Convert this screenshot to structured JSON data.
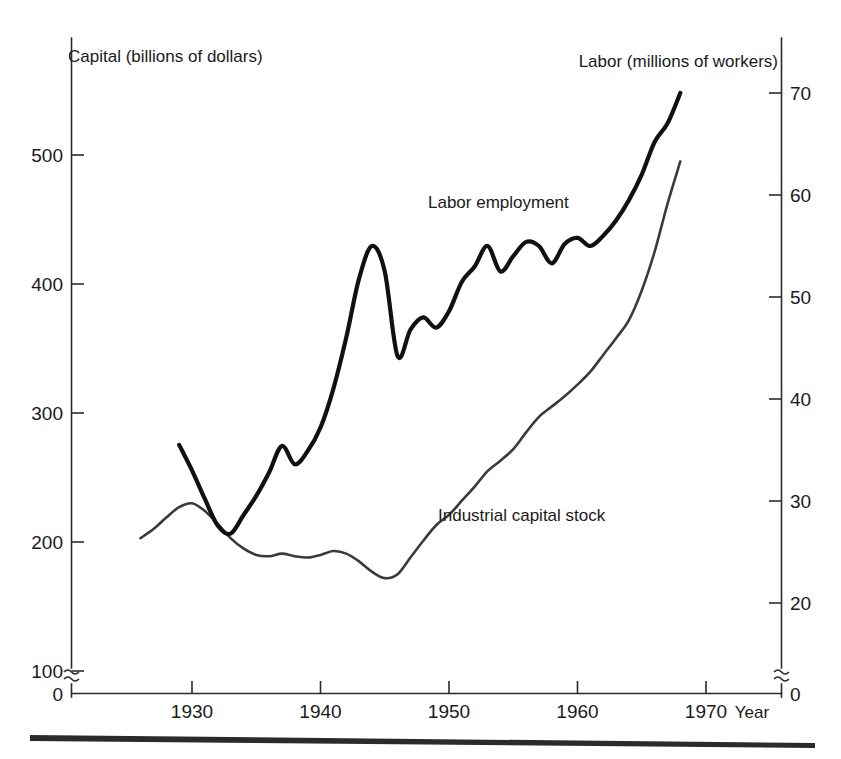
{
  "chart_data": {
    "type": "line",
    "title": "",
    "xlabel": "Year",
    "ylabel": "Capital (billions of dollars)",
    "y2label": "Labor (millions of workers)",
    "grid": false,
    "legend_position": "inline-annotation",
    "xlim": [
      1924,
      1974
    ],
    "xticks": [
      1930,
      1940,
      1950,
      1960,
      1970
    ],
    "xtick_labels": [
      "1930",
      "1940",
      "1950",
      "1960",
      "1970"
    ],
    "ylim": [
      100,
      560
    ],
    "yticks": [
      100,
      200,
      300,
      400,
      500
    ],
    "ytick_labels": [
      "100",
      "200",
      "300",
      "400",
      "500"
    ],
    "y_origin_label": "0",
    "y_axis_break": true,
    "y2lim": [
      20,
      72
    ],
    "y2ticks": [
      20,
      30,
      40,
      50,
      60,
      70
    ],
    "y2tick_labels": [
      "20",
      "30",
      "40",
      "50",
      "60",
      "70"
    ],
    "y2_origin_label": "0",
    "y2_axis_break": true,
    "series": [
      {
        "name": "Labor employment",
        "axis": "right",
        "units": "millions of workers",
        "x": [
          1929,
          1930,
          1931,
          1932,
          1933,
          1934,
          1935,
          1936,
          1937,
          1938,
          1939,
          1940,
          1941,
          1942,
          1943,
          1944,
          1945,
          1946,
          1947,
          1948,
          1949,
          1950,
          1951,
          1952,
          1953,
          1954,
          1955,
          1956,
          1957,
          1958,
          1959,
          1960,
          1961,
          1962,
          1963,
          1964,
          1965,
          1966,
          1967,
          1968
        ],
        "values": [
          35.5,
          33.0,
          30.2,
          27.6,
          26.8,
          28.6,
          30.5,
          32.8,
          35.4,
          33.6,
          34.9,
          37.2,
          41.0,
          46.0,
          51.8,
          55.0,
          52.5,
          44.2,
          46.8,
          48.0,
          47.0,
          48.6,
          51.5,
          53.0,
          55.0,
          52.5,
          54.0,
          55.4,
          55.0,
          53.3,
          55.2,
          55.8,
          55.0,
          56.0,
          57.5,
          59.5,
          62.0,
          65.2,
          67.0,
          70.0
        ]
      },
      {
        "name": "Industrial capital stock",
        "axis": "left",
        "units": "billions of dollars",
        "x": [
          1926,
          1927,
          1928,
          1929,
          1930,
          1931,
          1932,
          1933,
          1934,
          1935,
          1936,
          1937,
          1938,
          1939,
          1940,
          1941,
          1942,
          1943,
          1944,
          1945,
          1946,
          1947,
          1948,
          1949,
          1950,
          1951,
          1952,
          1953,
          1954,
          1955,
          1956,
          1957,
          1958,
          1959,
          1960,
          1961,
          1962,
          1963,
          1964,
          1965,
          1966,
          1967,
          1968
        ],
        "values": [
          203,
          210,
          219,
          227,
          230,
          224,
          214,
          203,
          195,
          190,
          189,
          191,
          189,
          188,
          190,
          193,
          191,
          185,
          177,
          172,
          175,
          188,
          201,
          213,
          221,
          232,
          243,
          255,
          263,
          272,
          285,
          297,
          305,
          313,
          322,
          332,
          345,
          358,
          372,
          395,
          425,
          462,
          495
        ]
      }
    ],
    "annotations": [
      {
        "text": "Labor employment",
        "x_px": 428,
        "y_px": 208
      },
      {
        "text": "Industrial capital stock",
        "x_px": 438,
        "y_px": 521
      }
    ]
  },
  "axes": {
    "left_title": "Capital (billions of dollars)",
    "right_title": "Labor (millions of workers)",
    "x_title": "Year",
    "left_ticks": [
      "500",
      "400",
      "300",
      "200",
      "100"
    ],
    "left_origin": "0",
    "right_ticks": [
      "70",
      "60",
      "50",
      "40",
      "30",
      "20"
    ],
    "right_origin": "0",
    "x_ticks": [
      "1930",
      "1940",
      "1950",
      "1960",
      "1970"
    ]
  },
  "series_labels": {
    "labor": "Labor employment",
    "capital": "Industrial capital stock"
  },
  "colors": {
    "labor_line": "#111111",
    "capital_line": "#3a3a3a",
    "axis": "#2b2b2b",
    "text": "#1a1a1a",
    "background": "#ffffff"
  }
}
